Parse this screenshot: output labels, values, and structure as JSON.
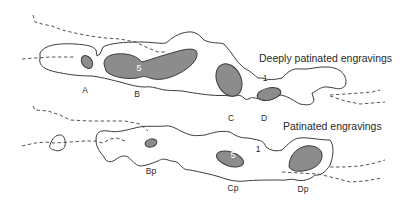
{
  "diagram": {
    "panels": [
      {
        "title": "Deeply patinated engravings",
        "contour_label": "1",
        "inner_label": "5",
        "engravings": [
          "A",
          "B",
          "C",
          "D"
        ]
      },
      {
        "title": "Patinated engravings",
        "contour_label": "1",
        "inner_label": "5",
        "engravings": [
          "Bp",
          "Cp",
          "Dp"
        ]
      }
    ],
    "colors": {
      "fill": "#8c8c8c",
      "outline": "#3c3c3c",
      "background": "#ffffff"
    }
  }
}
